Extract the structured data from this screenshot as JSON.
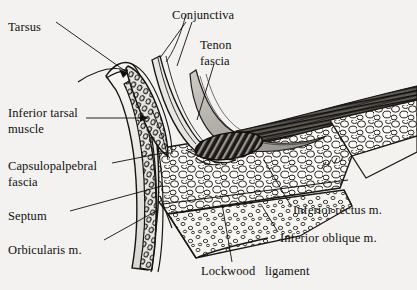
{
  "figure": {
    "type": "anatomical-illustration",
    "background_color": "#f3f2f0",
    "ink_color": "#100f0d",
    "labels": [
      {
        "id": "tarsus",
        "text": "Tarsus",
        "x": 8,
        "y": 20,
        "align": "left"
      },
      {
        "id": "conjunctiva",
        "text": "Conjunctiva",
        "x": 172,
        "y": 8,
        "align": "left"
      },
      {
        "id": "tenon-fascia-l1",
        "text": "Tenon",
        "x": 200,
        "y": 38,
        "align": "left"
      },
      {
        "id": "tenon-fascia-l2",
        "text": "fascia",
        "x": 200,
        "y": 54,
        "align": "left"
      },
      {
        "id": "inferior-tarsal-l1",
        "text": "Inferior tarsal",
        "x": 8,
        "y": 106,
        "align": "left"
      },
      {
        "id": "inferior-tarsal-l2",
        "text": "muscle",
        "x": 8,
        "y": 122,
        "align": "left"
      },
      {
        "id": "capsulopalpebral-l1",
        "text": "Capsulopalpebral",
        "x": 8,
        "y": 159,
        "align": "left"
      },
      {
        "id": "capsulopalpebral-l2",
        "text": "fascia",
        "x": 8,
        "y": 175,
        "align": "left"
      },
      {
        "id": "septum",
        "text": "Septum",
        "x": 8,
        "y": 209,
        "align": "left"
      },
      {
        "id": "orbicularis",
        "text": "Orbicularis m.",
        "x": 8,
        "y": 243,
        "align": "left"
      },
      {
        "id": "inferior-rectus",
        "text": "Inferior rectus m.",
        "x": 293,
        "y": 203,
        "align": "left"
      },
      {
        "id": "inferior-oblique",
        "text": "Inferior oblique m.",
        "x": 280,
        "y": 231,
        "align": "left"
      },
      {
        "id": "lockwood-ligament",
        "text": "Lockwood   ligament",
        "x": 201,
        "y": 264,
        "align": "left"
      }
    ],
    "structures": [
      {
        "id": "tarsal-plate",
        "name": "tarsus-meibomian-glands"
      },
      {
        "id": "conjunctival-fornix",
        "name": "conjunctival-fornix"
      },
      {
        "id": "tenon-capsule",
        "name": "tenon-capsule-fascia"
      },
      {
        "id": "orbital-fat-pad",
        "name": "orbital-fat-lobules"
      },
      {
        "id": "inferior-rectus",
        "name": "inferior-rectus-muscle-fibers"
      },
      {
        "id": "inferior-oblique",
        "name": "inferior-oblique-muscle-cross-section"
      },
      {
        "id": "lockwood",
        "name": "lockwood-ligament-band"
      },
      {
        "id": "orbicularis-muscle",
        "name": "orbicularis-oculi-muscle"
      },
      {
        "id": "orbital-septum",
        "name": "orbital-septum"
      },
      {
        "id": "skin-surface",
        "name": "eyelid-skin-surface"
      }
    ]
  }
}
